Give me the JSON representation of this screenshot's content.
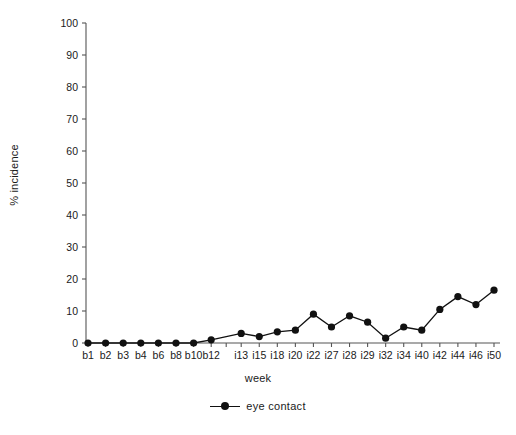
{
  "chart_data": {
    "type": "line",
    "title": "",
    "xlabel": "week",
    "ylabel": "% incidence",
    "ylim": [
      0,
      100
    ],
    "yticks": [
      0,
      10,
      20,
      30,
      40,
      50,
      60,
      70,
      80,
      90,
      100
    ],
    "grid": false,
    "legend_position": "bottom-center",
    "axis_break": true,
    "categories": [
      "b1",
      "b2",
      "b3",
      "b4",
      "b6",
      "b8",
      "b10",
      "b12",
      "i13",
      "i15",
      "i18",
      "i20",
      "i22",
      "i27",
      "i28",
      "i29",
      "i32",
      "i34",
      "i40",
      "i42",
      "i44",
      "i46",
      "i50"
    ],
    "series": [
      {
        "name": "eye contact",
        "color": "#111111",
        "values": [
          0,
          0,
          0,
          0,
          0,
          0,
          0,
          1,
          3,
          2,
          3.5,
          4,
          9,
          5,
          8.5,
          6.5,
          1.5,
          5,
          4,
          10.5,
          14.5,
          12,
          16.5
        ]
      }
    ]
  },
  "axis": {
    "y_tick_labels": [
      "100",
      "90",
      "80",
      "70",
      "60",
      "50",
      "40",
      "30",
      "20",
      "10",
      "0"
    ],
    "x_tick_labels": [
      "b1",
      "b2",
      "b3",
      "b4",
      "b6",
      "b8",
      "b10",
      "b12",
      "i13",
      "i15",
      "i18",
      "i20",
      "i22",
      "i27",
      "i28",
      "i29",
      "i32",
      "i34",
      "i40",
      "i42",
      "i44",
      "i46",
      "i50"
    ],
    "y_title": "% incidence",
    "x_title": "week"
  },
  "legend": {
    "entries": [
      {
        "label": "eye contact",
        "marker": "line-dot"
      }
    ]
  }
}
